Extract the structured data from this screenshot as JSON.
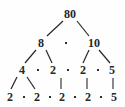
{
  "figure": {
    "background_color": "#fefefe",
    "ink_color": "#272727",
    "separator_symbol": "·"
  },
  "chart_data": {
    "type": "diagram",
    "diagram_kind": "factor-tree",
    "root_value": 80,
    "levels": [
      {
        "index": 0,
        "nodes": [
          {
            "label": "80",
            "x": 70,
            "y": 14
          }
        ],
        "separators": []
      },
      {
        "index": 1,
        "nodes": [
          {
            "label": "8",
            "x": 41,
            "y": 43
          },
          {
            "label": "10",
            "x": 94,
            "y": 43
          }
        ],
        "separators": [
          {
            "symbol": "·",
            "x": 66,
            "y": 43
          }
        ]
      },
      {
        "index": 2,
        "nodes": [
          {
            "label": "4",
            "x": 22,
            "y": 70
          },
          {
            "label": "2",
            "x": 53,
            "y": 70
          },
          {
            "label": "2",
            "x": 83,
            "y": 70
          },
          {
            "label": "5",
            "x": 112,
            "y": 70
          }
        ],
        "separators": [
          {
            "symbol": "·",
            "x": 38,
            "y": 70
          },
          {
            "symbol": "·",
            "x": 68,
            "y": 70
          },
          {
            "symbol": "·",
            "x": 98,
            "y": 70
          }
        ]
      },
      {
        "index": 3,
        "nodes": [
          {
            "label": "2",
            "x": 10,
            "y": 97
          },
          {
            "label": "2",
            "x": 37,
            "y": 97
          },
          {
            "label": "2",
            "x": 62,
            "y": 97
          },
          {
            "label": "2",
            "x": 88,
            "y": 97
          },
          {
            "label": "5",
            "x": 114,
            "y": 97
          }
        ],
        "separators": [
          {
            "symbol": "·",
            "x": 24,
            "y": 97
          },
          {
            "symbol": "·",
            "x": 50,
            "y": 97
          },
          {
            "symbol": "·",
            "x": 75,
            "y": 97
          },
          {
            "symbol": "·",
            "x": 101,
            "y": 97
          }
        ]
      }
    ],
    "edges": [
      {
        "from": "80",
        "to": "8",
        "x1": 63,
        "y1": 21,
        "x2": 47,
        "y2": 36,
        "kind": "diagonal"
      },
      {
        "from": "80",
        "to": "10",
        "x1": 77,
        "y1": 21,
        "x2": 89,
        "y2": 36,
        "kind": "diagonal"
      },
      {
        "from": "8",
        "to": "4",
        "x1": 36,
        "y1": 50,
        "x2": 25,
        "y2": 63,
        "kind": "diagonal"
      },
      {
        "from": "8",
        "to": "2",
        "x1": 46,
        "y1": 50,
        "x2": 52,
        "y2": 63,
        "kind": "diagonal"
      },
      {
        "from": "10",
        "to": "2",
        "x1": 89,
        "y1": 50,
        "x2": 83,
        "y2": 63,
        "kind": "diagonal"
      },
      {
        "from": "10",
        "to": "5",
        "x1": 99,
        "y1": 50,
        "x2": 110,
        "y2": 63,
        "kind": "diagonal"
      },
      {
        "from": "4",
        "to": "2",
        "x1": 17,
        "y1": 77,
        "x2": 11,
        "y2": 89,
        "kind": "diagonal"
      },
      {
        "from": "4",
        "to": "2",
        "x1": 27,
        "y1": 77,
        "x2": 35,
        "y2": 89,
        "kind": "diagonal"
      },
      {
        "from": "2",
        "to": "2",
        "x1": 61,
        "y1": 78,
        "x2": 61,
        "y2": 89,
        "kind": "vertical"
      },
      {
        "from": "2",
        "to": "2",
        "x1": 87,
        "y1": 78,
        "x2": 87,
        "y2": 89,
        "kind": "vertical"
      },
      {
        "from": "5",
        "to": "5",
        "x1": 113,
        "y1": 78,
        "x2": 113,
        "y2": 89,
        "kind": "vertical"
      }
    ],
    "leaf_factorization": [
      "2",
      "2",
      "2",
      "2",
      "5"
    ],
    "notes": "80 = 8 · 10 = (4 · 2) · (2 · 5) = 2 · 2 · 2 · 2 · 5"
  }
}
